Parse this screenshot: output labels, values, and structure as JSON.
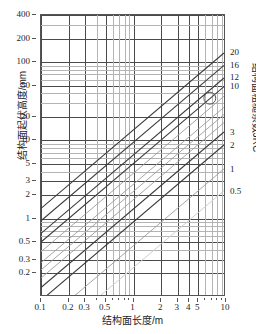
{
  "chart_data": {
    "type": "line",
    "title": "",
    "xlabel": "结构面长度/m",
    "ylabel": "结构面起伏高度/mm",
    "rlabel": "结构面粗糙系数JRC",
    "xscale": "log",
    "yscale": "log",
    "xlim": [
      0.1,
      10
    ],
    "ylim": [
      0.1,
      400
    ],
    "grid": true,
    "legend_position": "right-axis",
    "xticks": [
      {
        "value": 0.1,
        "label": "0.1"
      },
      {
        "value": 0.2,
        "label": "0.2"
      },
      {
        "value": 0.3,
        "label": "0.3"
      },
      {
        "value": 0.5,
        "label": "0.5"
      },
      {
        "value": 1,
        "label": "1"
      },
      {
        "value": 2,
        "label": "2"
      },
      {
        "value": 3,
        "label": "3"
      },
      {
        "value": 4,
        "label": "4"
      },
      {
        "value": 5,
        "label": "5"
      },
      {
        "value": 10,
        "label": "10"
      }
    ],
    "xminor": [
      0.4,
      0.6,
      0.7,
      0.8,
      0.9,
      6,
      7,
      8,
      9
    ],
    "yticks": [
      {
        "value": 400,
        "label": "400"
      },
      {
        "value": 200,
        "label": "200"
      },
      {
        "value": 100,
        "label": "100"
      },
      {
        "value": 50,
        "label": "50"
      },
      {
        "value": 20,
        "label": "20"
      },
      {
        "value": 10,
        "label": "10"
      },
      {
        "value": 5,
        "label": "5"
      },
      {
        "value": 3,
        "label": "3"
      },
      {
        "value": 2,
        "label": "2"
      },
      {
        "value": 1,
        "label": "1"
      },
      {
        "value": 0.5,
        "label": "0.5"
      },
      {
        "value": 0.3,
        "label": "0.3"
      },
      {
        "value": 0.2,
        "label": "0.2"
      }
    ],
    "yminor": [
      0.4,
      0.6,
      0.7,
      0.8,
      0.9,
      4,
      6,
      7,
      8,
      9,
      30,
      40,
      60,
      70,
      80,
      90,
      300
    ],
    "series": [
      {
        "name": "20",
        "label": "20",
        "jrc": 20,
        "y_at_x1": 13.0,
        "slope": 1.0,
        "weight": "bold"
      },
      {
        "name": "16",
        "label": "16",
        "jrc": 16,
        "y_at_x1": 9.0,
        "slope": 1.0,
        "weight": "bold"
      },
      {
        "name": "12",
        "label": "12",
        "jrc": 12,
        "y_at_x1": 6.2,
        "slope": 1.0,
        "weight": "bold"
      },
      {
        "name": "10",
        "label": "10",
        "jrc": 10,
        "y_at_x1": 4.8,
        "slope": 1.0,
        "weight": "bold"
      },
      {
        "name": "8",
        "label": "",
        "jrc": 8,
        "y_at_x1": 3.6,
        "slope": 1.0,
        "weight": "light"
      },
      {
        "name": "6",
        "label": "",
        "jrc": 6,
        "y_at_x1": 2.6,
        "slope": 1.0,
        "weight": "light"
      },
      {
        "name": "5",
        "label": "",
        "jrc": 5,
        "y_at_x1": 2.1,
        "slope": 1.0,
        "weight": "light"
      },
      {
        "name": "4",
        "label": "",
        "jrc": 4,
        "y_at_x1": 1.65,
        "slope": 1.0,
        "weight": "light"
      },
      {
        "name": "3",
        "label": "3",
        "jrc": 3,
        "y_at_x1": 1.25,
        "slope": 1.0,
        "weight": "bold"
      },
      {
        "name": "2",
        "label": "2",
        "jrc": 2,
        "y_at_x1": 0.85,
        "slope": 1.0,
        "weight": "bold"
      },
      {
        "name": "1",
        "label": "1",
        "jrc": 1,
        "y_at_x1": 0.42,
        "slope": 1.0,
        "weight": "light"
      },
      {
        "name": "0.5",
        "label": "0.5",
        "jrc": 0.5,
        "y_at_x1": 0.22,
        "slope": 1.0,
        "weight": "faint"
      }
    ],
    "annotations": [
      {
        "name": "marker-circle",
        "x": 7.0,
        "y": 34.0,
        "shape": "circle",
        "radius": 6
      }
    ]
  }
}
